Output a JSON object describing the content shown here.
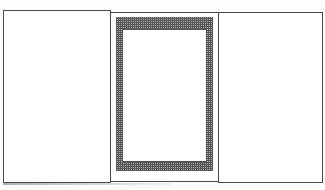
{
  "sketch": {
    "description": "Hand-drawn tri-fold panel with cross-hatched frame in the center panel",
    "panels": [
      {
        "name": "left",
        "content": ""
      },
      {
        "name": "center",
        "content": "cross-hatched rectangular frame with empty white opening"
      },
      {
        "name": "right",
        "content": ""
      }
    ],
    "colors": {
      "line": "#4a4a4a",
      "hatch": "#3a3a3a",
      "background": "#ffffff"
    }
  }
}
